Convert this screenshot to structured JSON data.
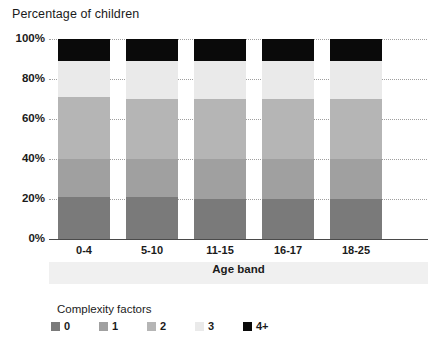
{
  "chart_data": {
    "type": "bar",
    "subtype": "stacked-percentage",
    "title": "Percentage of children",
    "xlabel": "Age band",
    "ylabel": "",
    "ylim": [
      0,
      100
    ],
    "grid": true,
    "legend_position": "bottom",
    "legend_title": "Complexity factors",
    "categories": [
      "0-4",
      "5-10",
      "11-15",
      "16-17",
      "18-25"
    ],
    "ytick_labels": [
      "0%",
      "20%",
      "40%",
      "60%",
      "80%",
      "100%"
    ],
    "ytick_values": [
      0,
      20,
      40,
      60,
      80,
      100
    ],
    "series": [
      {
        "name": "0",
        "color": "#7a7a7a",
        "values": [
          21,
          21,
          20,
          20,
          20
        ]
      },
      {
        "name": "1",
        "color": "#a0a0a0",
        "values": [
          19,
          19,
          20,
          20,
          20
        ]
      },
      {
        "name": "2",
        "color": "#b5b5b5",
        "values": [
          31,
          30,
          30,
          30,
          30
        ]
      },
      {
        "name": "3",
        "color": "#eaeaea",
        "values": [
          18,
          19,
          19,
          19,
          19
        ]
      },
      {
        "name": "4+",
        "color": "#0a0a0a",
        "values": [
          11,
          11,
          11,
          11,
          11
        ]
      }
    ]
  }
}
